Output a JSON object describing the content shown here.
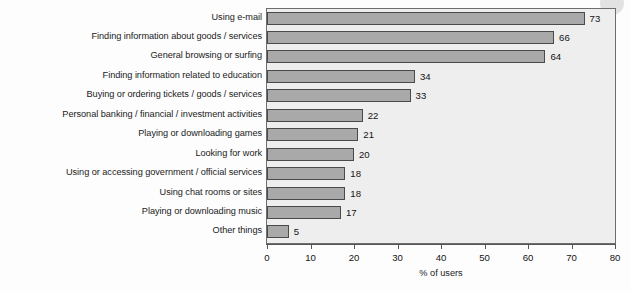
{
  "chart_data": {
    "type": "bar",
    "orientation": "horizontal",
    "title": "",
    "xlabel": "% of users",
    "ylabel": "",
    "xlim": [
      0,
      80
    ],
    "xticks": [
      "0",
      "10",
      "20",
      "30",
      "40",
      "50",
      "60",
      "70",
      "80"
    ],
    "grid": false,
    "legend": null,
    "categories": [
      "Using e-mail",
      "Finding information about goods / services",
      "General browsing or surfing",
      "Finding information related to education",
      "Buying or ordering tickets / goods / services",
      "Personal banking / financial / investment activities",
      "Playing or downloading games",
      "Looking for work",
      "Using or accessing government / official services",
      "Using chat rooms or sites",
      "Playing or downloading music",
      "Other things"
    ],
    "values": [
      73,
      66,
      64,
      34,
      33,
      22,
      21,
      20,
      18,
      18,
      17,
      5
    ],
    "value_labels": [
      "73",
      "66",
      "64",
      "34",
      "33",
      "22",
      "21",
      "20",
      "18",
      "18",
      "17",
      "5"
    ],
    "colors": {
      "bar_fill": "#a9a9a9",
      "bar_stroke": "#4a4a4a",
      "plot_background": "#eeeeee",
      "plot_border": "#6e6e6e",
      "text": "#141414",
      "page_background": "#fdfdfd"
    }
  }
}
